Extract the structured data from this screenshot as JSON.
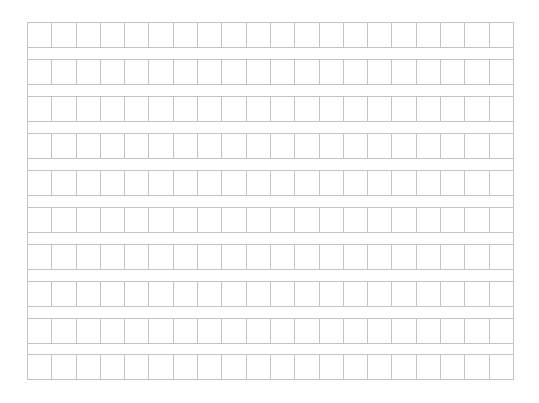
{
  "sheet": {
    "type": "genko-yoshi-manuscript-grid",
    "rows": 10,
    "columns": 20,
    "line_color": "#c4c4c4",
    "background_color": "#ffffff",
    "cells": [
      [
        "",
        "",
        "",
        "",
        "",
        "",
        "",
        "",
        "",
        "",
        "",
        "",
        "",
        "",
        "",
        "",
        "",
        "",
        "",
        ""
      ],
      [
        "",
        "",
        "",
        "",
        "",
        "",
        "",
        "",
        "",
        "",
        "",
        "",
        "",
        "",
        "",
        "",
        "",
        "",
        "",
        ""
      ],
      [
        "",
        "",
        "",
        "",
        "",
        "",
        "",
        "",
        "",
        "",
        "",
        "",
        "",
        "",
        "",
        "",
        "",
        "",
        "",
        ""
      ],
      [
        "",
        "",
        "",
        "",
        "",
        "",
        "",
        "",
        "",
        "",
        "",
        "",
        "",
        "",
        "",
        "",
        "",
        "",
        "",
        ""
      ],
      [
        "",
        "",
        "",
        "",
        "",
        "",
        "",
        "",
        "",
        "",
        "",
        "",
        "",
        "",
        "",
        "",
        "",
        "",
        "",
        ""
      ],
      [
        "",
        "",
        "",
        "",
        "",
        "",
        "",
        "",
        "",
        "",
        "",
        "",
        "",
        "",
        "",
        "",
        "",
        "",
        "",
        ""
      ],
      [
        "",
        "",
        "",
        "",
        "",
        "",
        "",
        "",
        "",
        "",
        "",
        "",
        "",
        "",
        "",
        "",
        "",
        "",
        "",
        ""
      ],
      [
        "",
        "",
        "",
        "",
        "",
        "",
        "",
        "",
        "",
        "",
        "",
        "",
        "",
        "",
        "",
        "",
        "",
        "",
        "",
        ""
      ],
      [
        "",
        "",
        "",
        "",
        "",
        "",
        "",
        "",
        "",
        "",
        "",
        "",
        "",
        "",
        "",
        "",
        "",
        "",
        "",
        ""
      ],
      [
        "",
        "",
        "",
        "",
        "",
        "",
        "",
        "",
        "",
        "",
        "",
        "",
        "",
        "",
        "",
        "",
        "",
        "",
        "",
        ""
      ]
    ]
  }
}
